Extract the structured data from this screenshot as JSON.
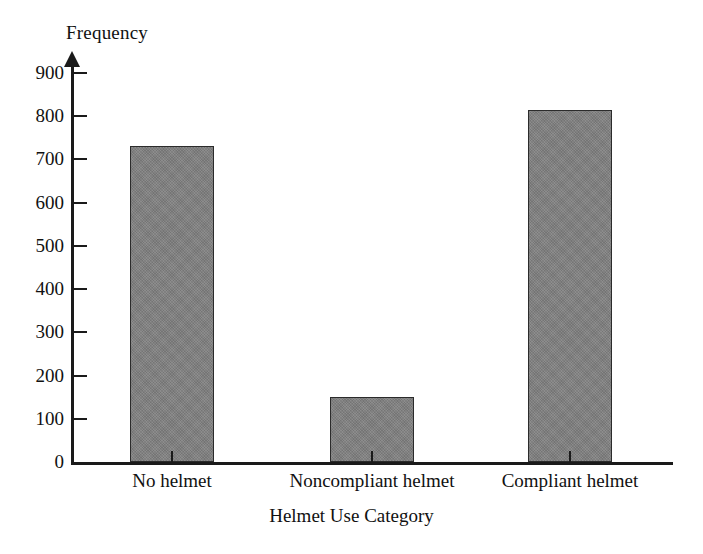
{
  "chart_data": {
    "type": "bar",
    "title": "",
    "subtitle": "",
    "xlabel": "Helmet Use Category",
    "ylabel": "Frequency",
    "categories": [
      "No helmet",
      "Noncompliant helmet",
      "Compliant helmet"
    ],
    "values": [
      730,
      150,
      815
    ],
    "ylim": [
      0,
      900
    ],
    "ytick_labels": [
      "0",
      "100",
      "200",
      "300",
      "400",
      "500",
      "600",
      "700",
      "800",
      "900"
    ],
    "ytick_values": [
      0,
      100,
      200,
      300,
      400,
      500,
      600,
      700,
      800,
      900
    ],
    "ytick_step": 100,
    "grid": false,
    "legend": false,
    "legend_position": "none",
    "bar_fill_color": "#808080",
    "bar_border_color": "#2b2b2b",
    "axis_color": "#1a1a1a",
    "background_color": "#ffffff",
    "y_axis_has_arrow": true,
    "annotations": []
  }
}
